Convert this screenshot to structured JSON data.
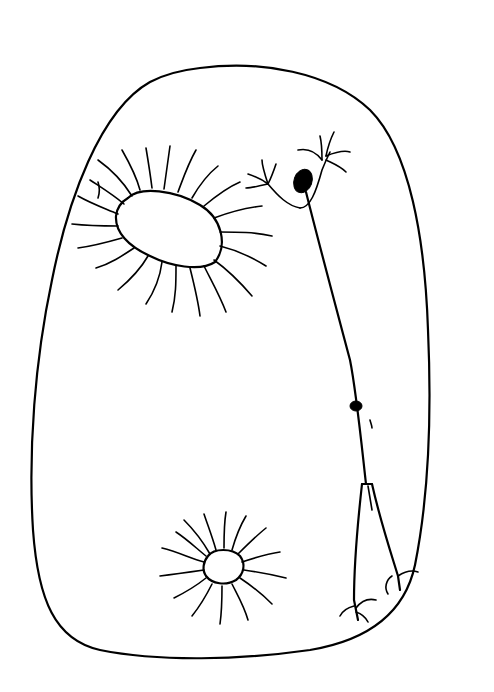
{
  "artwork": {
    "description": "Black ink line drawing of a large egg/pebble shape with two radiating hair-ringed openings and a thin stick figure with a black head",
    "stroke_color": "#000000",
    "background_color": "#ffffff"
  }
}
